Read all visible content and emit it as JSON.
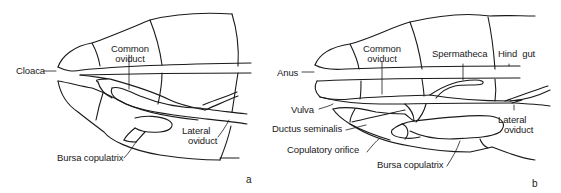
{
  "figure": {
    "panel_a": {
      "letter": "a",
      "labels": {
        "cloaca": "Cloaca",
        "common_oviduct_line1": "Common",
        "common_oviduct_line2": "oviduct",
        "bursa_copulatrix": "Bursa copulatrix",
        "lateral_oviduct_line1": "Lateral",
        "lateral_oviduct_line2": "oviduct"
      }
    },
    "panel_b": {
      "letter": "b",
      "labels": {
        "anus": "Anus",
        "common_oviduct_line1": "Common",
        "common_oviduct_line2": "oviduct",
        "spermatheca": "Spermatheca",
        "hind_gut": "Hind  gut",
        "vulva": "Vulva",
        "ductus_seminalis": "Ductus seminalis",
        "copulatory_orifice": "Copulatory orifice",
        "bursa_copulatrix": "Bursa copulatrix",
        "lateral_oviduct_line1": "Lateral",
        "lateral_oviduct_line2": "oviduct"
      }
    }
  }
}
